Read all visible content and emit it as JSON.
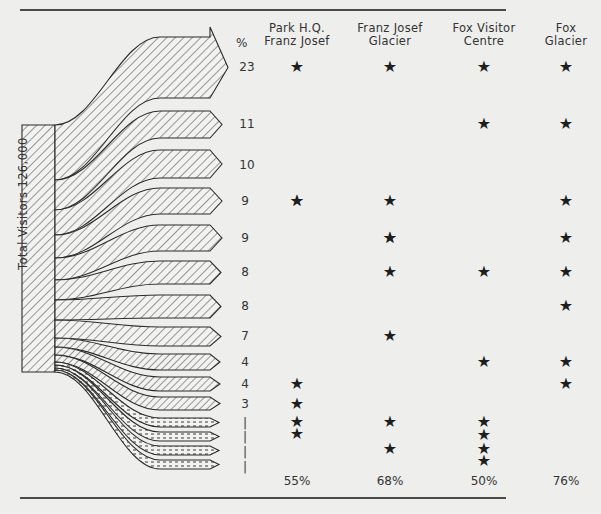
{
  "diagram": {
    "type": "sankey-flow",
    "source_label": "Total Visitors  126,000",
    "percent_header": "%",
    "columns": [
      {
        "line1": "Park  H.Q.",
        "line2": "Franz Josef",
        "total": "55%"
      },
      {
        "line1": "Franz Josef",
        "line2": "Glacier",
        "total": "68%"
      },
      {
        "line1": "Fox Visitor",
        "line2": "Centre",
        "total": "50%"
      },
      {
        "line1": "Fox",
        "line2": "Glacier",
        "total": "76%"
      }
    ],
    "rows": [
      {
        "pct": "23",
        "stops": [
          1,
          1,
          1,
          1
        ]
      },
      {
        "pct": "11",
        "stops": [
          0,
          0,
          1,
          1
        ]
      },
      {
        "pct": "10",
        "stops": [
          1,
          1,
          0,
          0
        ]
      },
      {
        "pct": "9",
        "stops": [
          1,
          1,
          0,
          1
        ]
      },
      {
        "pct": "9",
        "stops": [
          0,
          1,
          0,
          1
        ]
      },
      {
        "pct": "8",
        "stops": [
          0,
          1,
          1,
          1
        ]
      },
      {
        "pct": "8",
        "stops": [
          0,
          0,
          0,
          1
        ]
      },
      {
        "pct": "7",
        "stops": [
          0,
          1,
          0,
          0
        ]
      },
      {
        "pct": "4",
        "stops": [
          0,
          0,
          1,
          1
        ]
      },
      {
        "pct": "4",
        "stops": [
          1,
          0,
          0,
          1
        ]
      },
      {
        "pct": "3",
        "stops": [
          1,
          0,
          0,
          0
        ]
      },
      {
        "pct": "1",
        "stops": [
          1,
          1,
          1,
          0
        ]
      },
      {
        "pct": "1",
        "stops": [
          1,
          0,
          1,
          0
        ]
      },
      {
        "pct": "1",
        "stops": [
          0,
          1,
          1,
          0
        ]
      },
      {
        "pct": "1",
        "stops": [
          0,
          0,
          1,
          0
        ]
      }
    ],
    "star_glyph": "★"
  },
  "chart_data": {
    "type": "sankey",
    "title": "",
    "source": {
      "label": "Total Visitors",
      "value": 126000
    },
    "categories": [
      "Park H.Q. Franz Josef",
      "Franz Josef Glacier",
      "Fox Visitor Centre",
      "Fox Glacier"
    ],
    "flows_percent": [
      23,
      11,
      10,
      9,
      9,
      8,
      8,
      7,
      4,
      4,
      3,
      1,
      1,
      1,
      1
    ],
    "column_totals_percent": [
      55,
      68,
      50,
      76
    ]
  }
}
